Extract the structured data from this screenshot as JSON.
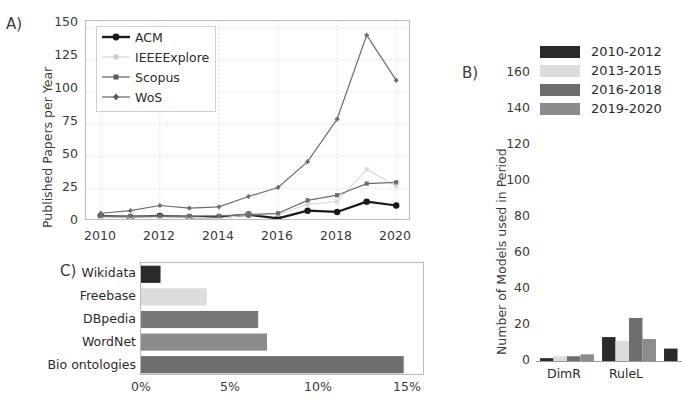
{
  "figure": {
    "panels": [
      {
        "letter": "A)"
      },
      {
        "letter": "B)"
      },
      {
        "letter": "C)"
      }
    ]
  },
  "colors": {
    "series_acm": "#1a1a1a",
    "series_ieee": "#d9d9d9",
    "series_scopus": "#6e6e6e",
    "series_wos": "#6e6e6e",
    "period_2010_2012": "#2a2a2a",
    "period_2013_2015": "#dcdcdc",
    "period_2016_2018": "#6e6e6e",
    "period_2019_2020": "#8c8c8c",
    "bar_wikidata": "#2a2a2a",
    "bar_freebase": "#dcdcdc",
    "bar_dbpedia": "#787878",
    "bar_wordnet": "#8c8c8c",
    "bar_bio": "#6e6e6e",
    "axis": "#b9b9b9",
    "grid": "#e3e3e3",
    "text": "#2b2b2b"
  },
  "chart_data": [
    {
      "id": "panel-a",
      "type": "line",
      "title": "",
      "xlabel": "",
      "ylabel": "Published Papers per Year",
      "xlim": [
        2009.5,
        2020.5
      ],
      "ylim": [
        0,
        155
      ],
      "xticks": [
        "2010",
        "2012",
        "2014",
        "2016",
        "2018",
        "2020"
      ],
      "xtick_values": [
        2010,
        2012,
        2014,
        2016,
        2018,
        2020
      ],
      "yticks": [
        "0",
        "25",
        "50",
        "75",
        "100",
        "125",
        "150"
      ],
      "ytick_values": [
        0,
        25,
        50,
        75,
        100,
        125,
        150
      ],
      "grid": true,
      "legend_position": "upper left",
      "x": [
        2010,
        2011,
        2012,
        2013,
        2014,
        2015,
        2016,
        2017,
        2018,
        2019,
        2020
      ],
      "series": [
        {
          "name": "ACM",
          "marker": "circle-filled",
          "color": "#1a1a1a",
          "linewidth": 2.2,
          "values": [
            4,
            3,
            4,
            3,
            3,
            5,
            2,
            8,
            7,
            15,
            12
          ]
        },
        {
          "name": "IEEEExplore",
          "marker": "square-small",
          "color": "#d9d9d9",
          "linewidth": 1.2,
          "values": [
            3,
            3,
            3,
            3,
            2,
            5,
            5,
            13,
            15,
            40,
            27
          ]
        },
        {
          "name": "Scopus",
          "marker": "square-small",
          "color": "#6e6e6e",
          "linewidth": 1.2,
          "values": [
            4,
            4,
            4,
            4,
            4,
            5,
            6,
            16,
            20,
            29,
            30
          ]
        },
        {
          "name": "WoS",
          "marker": "diamond-small",
          "color": "#6e6e6e",
          "linewidth": 1.2,
          "values": [
            6,
            8,
            12,
            10,
            11,
            19,
            26,
            46,
            79,
            144,
            109
          ]
        }
      ]
    },
    {
      "id": "panel-b",
      "type": "bar",
      "title": "",
      "xlabel": "",
      "ylabel": "Number of Models used in Period",
      "ylim": [
        0,
        168
      ],
      "yticks": [
        "0",
        "20",
        "40",
        "60",
        "80",
        "100",
        "120",
        "140",
        "160"
      ],
      "ytick_values": [
        0,
        20,
        40,
        60,
        80,
        100,
        120,
        140,
        160
      ],
      "grid": false,
      "legend_position": "upper right",
      "categories": [
        "DimR",
        "RuleL",
        ""
      ],
      "series": [
        {
          "name": "2010-2012",
          "color": "#2a2a2a",
          "values": [
            2,
            13,
            7
          ]
        },
        {
          "name": "2013-2015",
          "color": "#dcdcdc",
          "values": [
            3,
            11,
            0
          ]
        },
        {
          "name": "2016-2018",
          "color": "#6e6e6e",
          "values": [
            3,
            23,
            0
          ]
        },
        {
          "name": "2019-2020",
          "color": "#8c8c8c",
          "values": [
            4,
            12,
            0
          ]
        }
      ],
      "note": "third category group clipped at right edge of figure"
    },
    {
      "id": "panel-c",
      "type": "bar",
      "orientation": "horizontal",
      "title": "",
      "xlabel": "",
      "ylabel": "",
      "xlim": [
        0,
        16.0
      ],
      "xticks": [
        "0%",
        "5%",
        "10%",
        "15%"
      ],
      "xtick_values": [
        0,
        5,
        10,
        15
      ],
      "grid": false,
      "categories": [
        "Wikidata",
        "Freebase",
        "DBpedia",
        "WordNet",
        "Bio ontologies"
      ],
      "values": [
        1.1,
        3.7,
        6.6,
        7.1,
        14.8
      ],
      "bar_colors": [
        "#2a2a2a",
        "#dcdcdc",
        "#787878",
        "#8c8c8c",
        "#6e6e6e"
      ]
    }
  ]
}
